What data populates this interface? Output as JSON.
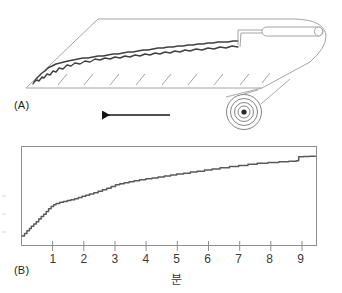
{
  "figure": {
    "panels": [
      {
        "id": "A",
        "label": "(A)",
        "description": "perspective line drawing of an unrolling mat with wavy surface profile, spiral roll and handle",
        "arrow_direction": "left",
        "hatch_count": 9
      },
      {
        "id": "B",
        "label": "(B)",
        "description": "cumulative staircase curve plot"
      }
    ]
  },
  "chart_data": {
    "type": "line",
    "title": "",
    "subtitle": "",
    "xlabel": "분",
    "ylabel": "",
    "xlim": [
      0,
      9.5
    ],
    "ylim": [
      0,
      1.05
    ],
    "grid": false,
    "legend": null,
    "xticks": [
      1,
      2,
      3,
      4,
      5,
      6,
      7,
      8,
      9
    ],
    "xtick_labels": [
      "1",
      "2",
      "3",
      "4",
      "5",
      "6",
      "7",
      "8",
      "9"
    ],
    "yticks": [],
    "ytick_labels": [],
    "series": [
      {
        "name": "cumulative",
        "step": true,
        "color": "#5a5a5a",
        "x": [
          0.0,
          0.08,
          0.16,
          0.24,
          0.3,
          0.38,
          0.46,
          0.54,
          0.62,
          0.7,
          0.78,
          0.86,
          0.94,
          1.02,
          1.1,
          1.22,
          1.34,
          1.46,
          1.58,
          1.7,
          1.82,
          1.94,
          2.06,
          2.18,
          2.32,
          2.46,
          2.6,
          2.74,
          2.88,
          3.02,
          3.16,
          3.3,
          3.46,
          3.62,
          3.8,
          4.0,
          4.2,
          4.4,
          4.6,
          4.8,
          5.0,
          5.22,
          5.44,
          5.66,
          5.9,
          6.14,
          6.4,
          6.7,
          7.0,
          7.3,
          7.6,
          7.95,
          8.3,
          8.62,
          8.86,
          8.94,
          9.1,
          9.3,
          9.48
        ],
        "y": [
          0.055,
          0.085,
          0.115,
          0.14,
          0.165,
          0.19,
          0.215,
          0.245,
          0.275,
          0.3,
          0.33,
          0.36,
          0.385,
          0.405,
          0.42,
          0.432,
          0.442,
          0.452,
          0.462,
          0.472,
          0.486,
          0.5,
          0.512,
          0.524,
          0.54,
          0.556,
          0.572,
          0.59,
          0.61,
          0.628,
          0.64,
          0.65,
          0.662,
          0.672,
          0.684,
          0.694,
          0.704,
          0.714,
          0.726,
          0.736,
          0.748,
          0.758,
          0.77,
          0.78,
          0.792,
          0.804,
          0.818,
          0.832,
          0.844,
          0.856,
          0.868,
          0.878,
          0.886,
          0.892,
          0.896,
          0.94,
          0.944,
          0.946,
          0.948
        ]
      }
    ],
    "annotations": []
  },
  "style": {
    "axis_color": "#7a7a7a",
    "curve_color": "#5a5a5a",
    "outline_color": "#9a9a9a",
    "profile_color": "#404040",
    "arrow_color": "#141414",
    "text_color": "#231f20",
    "background": "#ffffff"
  }
}
